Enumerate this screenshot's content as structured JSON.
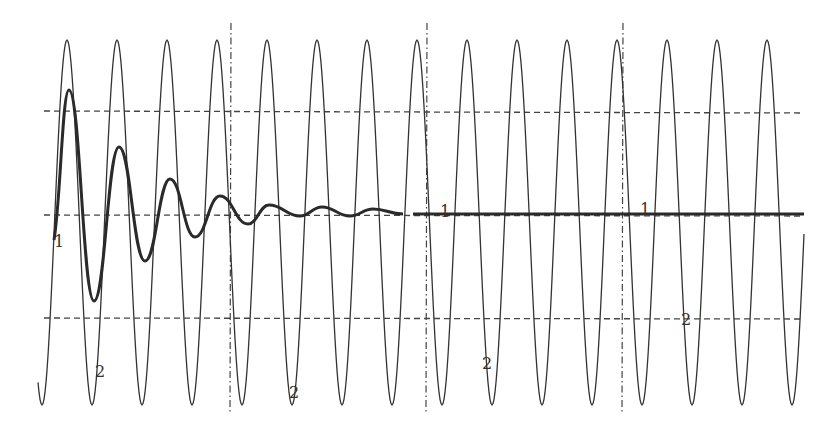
{
  "chart_data": {
    "type": "line",
    "title": "",
    "xlabel": "",
    "ylabel": "",
    "grid": false,
    "legend": null,
    "series": [
      {
        "name": "1",
        "style": "thick solid",
        "damped_extrema_px": [
          [
            54,
            240
          ],
          [
            69,
            90
          ],
          [
            94,
            301
          ],
          [
            119,
            147
          ],
          [
            145,
            261
          ],
          [
            170,
            179
          ],
          [
            195,
            237
          ],
          [
            220,
            196
          ],
          [
            248,
            224
          ],
          [
            269,
            205
          ],
          [
            300,
            216
          ],
          [
            322,
            207
          ],
          [
            350,
            216
          ],
          [
            373,
            209
          ],
          [
            403,
            214
          ]
        ],
        "steady_segment_px": [
          [
            413,
            214
          ],
          [
            804,
            214
          ]
        ]
      },
      {
        "name": "2",
        "style": "thin solid",
        "period_px": 50,
        "peak_x_px": [
          67,
          116,
          165,
          216,
          265,
          316,
          366,
          416,
          464,
          515,
          564,
          615,
          667,
          717,
          767
        ],
        "peak_y_px": 40,
        "trough_y_px": 405,
        "start_px": [
          38,
          410
        ],
        "end_px": [
          804,
          172
        ]
      }
    ],
    "reference_lines": {
      "horizontal_dashed_y_px": [
        111,
        215,
        318
      ],
      "vertical_dashdot_x_px": [
        231,
        427,
        623
      ]
    },
    "annotations": [
      {
        "text": "1",
        "x": 54,
        "y": 247
      },
      {
        "text": "1",
        "x": 440,
        "y": 217
      },
      {
        "text": "1",
        "x": 640,
        "y": 215
      },
      {
        "text": "2",
        "x": 95,
        "y": 377
      },
      {
        "text": "2",
        "x": 289,
        "y": 398
      },
      {
        "text": "2",
        "x": 482,
        "y": 369
      },
      {
        "text": "2",
        "x": 681,
        "y": 325
      }
    ]
  },
  "colors": {
    "curve": "#333333",
    "reference": "#444444",
    "background": "#ffffff"
  },
  "labels": {
    "curve1": "1",
    "curve2": "2"
  }
}
